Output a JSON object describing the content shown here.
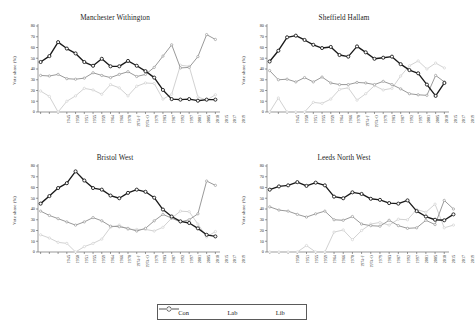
{
  "chart_data": {
    "type": "line",
    "title": "",
    "xlabel": "",
    "ylabel": "Vote share (%)",
    "ylim": [
      0,
      80
    ],
    "yticks": [
      0,
      10,
      20,
      30,
      40,
      50,
      60,
      70,
      80
    ],
    "grid": false,
    "legend_position": "bottom-center",
    "legend": [
      "Con",
      "Lab",
      "Lib"
    ],
    "series_colors": {
      "Con": "#1a1a1a",
      "Lab": "#9a9a9a",
      "Lib": "#d2d2d2"
    },
    "categories": [
      "1945",
      "1950",
      "1951",
      "1955",
      "1959",
      "1964",
      "1966",
      "1970",
      "1974-F",
      "1974-O",
      "1979",
      "1983",
      "1987",
      "1992",
      "1997",
      "2001",
      "2005",
      "2010",
      "2015",
      "2017",
      "2019"
    ],
    "panels": [
      {
        "title": "Manchester Withington",
        "categories": [
          "1945",
          "1950",
          "1951",
          "1955",
          "1959",
          "1964",
          "1966",
          "1970",
          "1974-F",
          "1974-O",
          "1979",
          "1983",
          "1987",
          "1992",
          "1997",
          "2001",
          "2005",
          "2010",
          "2015",
          "2017",
          "2019"
        ],
        "series": [
          {
            "name": "Con",
            "values": [
              46.5,
              52.0,
              65.0,
              59.0,
              54.5,
              46.5,
              43.0,
              49.5,
              42.5,
              42.5,
              47.5,
              43.0,
              38.0,
              32.0,
              20.5,
              12.0,
              11.5,
              12.0,
              10.5,
              11.5,
              11.5
            ]
          },
          {
            "name": "Lab",
            "values": [
              34.0,
              33.5,
              35.0,
              31.0,
              30.5,
              31.5,
              36.5,
              34.0,
              32.0,
              35.0,
              37.5,
              33.0,
              35.0,
              41.5,
              52.0,
              62.5,
              41.0,
              41.5,
              51.5,
              72.0,
              67.5
            ]
          },
          {
            "name": "Lib",
            "values": [
              19.5,
              14.5,
              0.0,
              10.0,
              15.0,
              22.0,
              20.5,
              16.5,
              25.5,
              22.5,
              15.0,
              24.0,
              27.0,
              26.5,
              12.0,
              16.5,
              43.5,
              42.5,
              14.0,
              11.0,
              16.0
            ]
          }
        ]
      },
      {
        "title": "Sheffield Hallam",
        "categories": [
          "1945",
          "1950",
          "1951",
          "1955",
          "1959",
          "1964",
          "1966",
          "1970",
          "1974-F",
          "1974-O",
          "1979",
          "1983",
          "1987",
          "1992",
          "1997",
          "2001",
          "2005",
          "2010",
          "2015",
          "2017",
          "2019"
        ],
        "series": [
          {
            "name": "Con",
            "values": [
              47.0,
              57.0,
              69.5,
              71.0,
              67.0,
              62.5,
              59.5,
              60.5,
              53.0,
              51.5,
              61.0,
              55.5,
              49.5,
              50.5,
              51.5,
              44.5,
              39.0,
              36.0,
              25.5,
              15.0,
              27.0
            ]
          },
          {
            "name": "Lab",
            "values": [
              38.5,
              30.0,
              30.5,
              28.0,
              32.0,
              28.0,
              32.5,
              27.0,
              25.5,
              25.5,
              27.5,
              27.0,
              25.5,
              28.5,
              25.5,
              21.5,
              17.0,
              16.0,
              15.5,
              34.0,
              28.0
            ]
          },
          {
            "name": "Lib",
            "values": [
              0.0,
              13.0,
              0.0,
              0.0,
              0.0,
              9.0,
              8.0,
              12.0,
              21.0,
              22.5,
              11.0,
              17.0,
              24.5,
              20.5,
              22.0,
              33.5,
              43.0,
              47.5,
              40.0,
              45.5,
              41.0
            ]
          }
        ]
      },
      {
        "title": "Bristol West",
        "categories": [
          "1945",
          "1950",
          "1951",
          "1955",
          "1959",
          "1964",
          "1966",
          "1970",
          "1974-F",
          "1974-O",
          "1979",
          "1983",
          "1987",
          "1992",
          "1997",
          "2001",
          "2005",
          "2010",
          "2015",
          "2017",
          "2019"
        ],
        "series": [
          {
            "name": "Con",
            "values": [
              45.0,
              52.0,
              59.5,
              64.0,
              75.0,
              66.5,
              59.5,
              58.0,
              52.5,
              50.0,
              55.0,
              58.0,
              56.0,
              50.5,
              39.5,
              33.0,
              28.5,
              27.0,
              22.0,
              16.0,
              14.5
            ]
          },
          {
            "name": "Lab",
            "values": [
              38.0,
              34.0,
              31.0,
              28.0,
              25.0,
              28.0,
              32.0,
              29.0,
              24.0,
              23.5,
              22.0,
              19.5,
              22.0,
              29.0,
              35.0,
              31.5,
              28.0,
              30.0,
              35.5,
              66.0,
              62.0
            ]
          },
          {
            "name": "Lib",
            "values": [
              16.0,
              13.0,
              9.0,
              8.0,
              0.0,
              5.0,
              8.0,
              12.0,
              23.0,
              25.0,
              21.0,
              21.0,
              21.0,
              19.5,
              23.0,
              31.5,
              38.0,
              37.5,
              26.0,
              14.0,
              19.0
            ]
          }
        ]
      },
      {
        "title": "Leeds North West",
        "categories": [
          "1950",
          "1951",
          "1955",
          "1959",
          "1964",
          "1966",
          "1970",
          "1974-F",
          "1974-O",
          "1979",
          "1983",
          "1987",
          "1992",
          "1997",
          "2001",
          "2005",
          "2010",
          "2015",
          "2017",
          "2019"
        ],
        "series": [
          {
            "name": "Con",
            "values": [
              58.0,
              61.0,
              62.0,
              65.0,
              61.5,
              64.5,
              62.0,
              51.5,
              50.0,
              55.5,
              54.0,
              49.5,
              48.5,
              45.5,
              45.0,
              48.0,
              38.0,
              33.0,
              30.0,
              29.5,
              35.0
            ]
          },
          {
            "name": "Lab",
            "values": [
              42.0,
              39.0,
              38.0,
              35.0,
              32.5,
              35.5,
              38.0,
              30.0,
              29.5,
              33.0,
              26.0,
              24.5,
              24.0,
              29.5,
              24.5,
              22.0,
              22.5,
              29.5,
              25.5,
              48.0,
              40.0
            ]
          },
          {
            "name": "Lib",
            "values": [
              0.0,
              0.0,
              0.0,
              0.0,
              6.0,
              0.0,
              0.0,
              18.5,
              20.5,
              11.5,
              20.0,
              26.0,
              27.5,
              25.0,
              30.5,
              30.0,
              39.5,
              37.0,
              44.5,
              22.5,
              25.0
            ]
          }
        ]
      }
    ]
  }
}
